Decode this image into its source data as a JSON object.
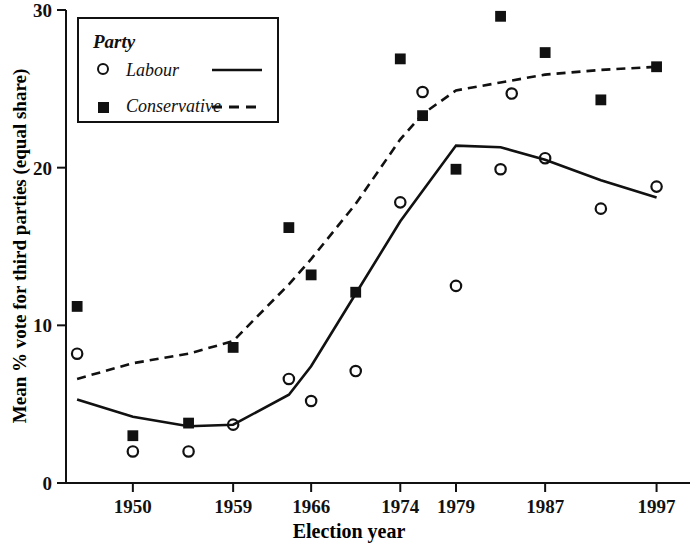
{
  "chart_data": {
    "type": "scatter",
    "title": "",
    "xlabel": "Election year",
    "ylabel": "Mean % vote for third parties (equal share)",
    "xlim": [
      1944,
      2000
    ],
    "ylim": [
      0,
      30
    ],
    "yticks": [
      "0",
      "10",
      "20",
      "30"
    ],
    "ytick_values": [
      0,
      10,
      20,
      30
    ],
    "xticks": [
      "1950",
      "1959",
      "1966",
      "1974",
      "1979",
      "1987",
      "1997"
    ],
    "xtick_values": [
      1950,
      1959,
      1966,
      1974,
      1979,
      1987,
      1997
    ],
    "grid": false,
    "legend_position": "top-left",
    "legend_title": "Party",
    "series": [
      {
        "name": "Labour",
        "marker": "open-circle",
        "line_style": "solid",
        "points": [
          {
            "x": 1945,
            "y": 8.2
          },
          {
            "x": 1950,
            "y": 2.0
          },
          {
            "x": 1955,
            "y": 2.0
          },
          {
            "x": 1959,
            "y": 3.7
          },
          {
            "x": 1964,
            "y": 6.6
          },
          {
            "x": 1966,
            "y": 5.2
          },
          {
            "x": 1970,
            "y": 7.1
          },
          {
            "x": 1974,
            "y": 17.8
          },
          {
            "x": 1979,
            "y": 12.5
          },
          {
            "x": 1983,
            "y": 19.9
          },
          {
            "x": 1987,
            "y": 20.6
          },
          {
            "x": 1992,
            "y": 17.4
          },
          {
            "x": 1997,
            "y": 18.8
          },
          {
            "x": 1976,
            "y": 24.8
          },
          {
            "x": 1984,
            "y": 24.7
          }
        ],
        "trend": [
          {
            "x": 1945,
            "y": 5.3
          },
          {
            "x": 1950,
            "y": 4.2
          },
          {
            "x": 1955,
            "y": 3.6
          },
          {
            "x": 1959,
            "y": 3.7
          },
          {
            "x": 1964,
            "y": 5.6
          },
          {
            "x": 1966,
            "y": 7.4
          },
          {
            "x": 1970,
            "y": 12.0
          },
          {
            "x": 1974,
            "y": 16.6
          },
          {
            "x": 1979,
            "y": 21.4
          },
          {
            "x": 1983,
            "y": 21.3
          },
          {
            "x": 1987,
            "y": 20.5
          },
          {
            "x": 1992,
            "y": 19.2
          },
          {
            "x": 1997,
            "y": 18.1
          }
        ]
      },
      {
        "name": "Conservative",
        "marker": "filled-square",
        "line_style": "dashed",
        "points": [
          {
            "x": 1945,
            "y": 11.2
          },
          {
            "x": 1950,
            "y": 3.0
          },
          {
            "x": 1955,
            "y": 3.8
          },
          {
            "x": 1964,
            "y": 16.2
          },
          {
            "x": 1966,
            "y": 13.2
          },
          {
            "x": 1970,
            "y": 12.1
          },
          {
            "x": 1974,
            "y": 26.9
          },
          {
            "x": 1976,
            "y": 23.3
          },
          {
            "x": 1979,
            "y": 19.9
          },
          {
            "x": 1983,
            "y": 29.6
          },
          {
            "x": 1987,
            "y": 27.3
          },
          {
            "x": 1992,
            "y": 24.3
          },
          {
            "x": 1997,
            "y": 26.4
          },
          {
            "x": 1959,
            "y": 8.6
          }
        ],
        "trend": [
          {
            "x": 1945,
            "y": 6.6
          },
          {
            "x": 1950,
            "y": 7.6
          },
          {
            "x": 1955,
            "y": 8.2
          },
          {
            "x": 1959,
            "y": 9.0
          },
          {
            "x": 1964,
            "y": 12.6
          },
          {
            "x": 1966,
            "y": 14.2
          },
          {
            "x": 1970,
            "y": 17.7
          },
          {
            "x": 1974,
            "y": 21.8
          },
          {
            "x": 1976,
            "y": 23.4
          },
          {
            "x": 1979,
            "y": 24.9
          },
          {
            "x": 1983,
            "y": 25.4
          },
          {
            "x": 1987,
            "y": 25.9
          },
          {
            "x": 1992,
            "y": 26.2
          },
          {
            "x": 1997,
            "y": 26.4
          }
        ]
      }
    ]
  },
  "axis": {
    "ylabel": "Mean % vote for third parties (equal share)",
    "xlabel": "Election year"
  },
  "legend": {
    "title": "Party",
    "items": [
      {
        "label": "Labour",
        "marker": "open-circle",
        "line": "solid"
      },
      {
        "label": "Conservative",
        "marker": "filled-square",
        "line": "dashed"
      }
    ]
  },
  "colors": {
    "ink": "#111111",
    "background": "#ffffff"
  }
}
